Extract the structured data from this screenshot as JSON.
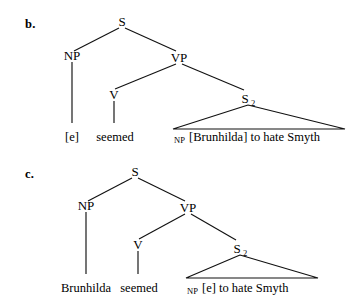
{
  "figure": {
    "background": "#ffffff",
    "ink": "#111111",
    "items": [
      {
        "id": "b",
        "item_label": "b.",
        "nodes": {
          "s": "S",
          "np": "NP",
          "vp": "VP",
          "v": "V",
          "s2_base": "S",
          "s2_sub": "2"
        },
        "terminals": {
          "np_terminal": "[e]",
          "v_terminal": "seemed",
          "triangle_category": "NP",
          "triangle_text": "[Brunhilda] to hate Smyth"
        }
      },
      {
        "id": "c",
        "item_label": "c.",
        "nodes": {
          "s": "S",
          "np": "NP",
          "vp": "VP",
          "v": "V",
          "s2_base": "S",
          "s2_sub": "2"
        },
        "terminals": {
          "np_terminal": "Brunhilda",
          "v_terminal": "seemed",
          "triangle_category": "NP",
          "triangle_text": "[e] to hate Smyth"
        }
      }
    ]
  }
}
